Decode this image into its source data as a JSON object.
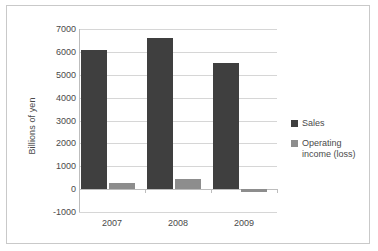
{
  "chart_data": {
    "type": "bar",
    "title": "",
    "subtitle": "",
    "xlabel": "",
    "ylabel": "Billions of yen",
    "categories": [
      "2007",
      "2008",
      "2009"
    ],
    "series": [
      {
        "name": "Sales",
        "color": "#3f3f3f",
        "values": [
          6100,
          6620,
          5500
        ]
      },
      {
        "name": "Operating income (loss)",
        "color": "#8d8d8d",
        "values": [
          250,
          440,
          -110
        ]
      }
    ],
    "ylim": [
      -1000,
      7000
    ],
    "ytick_labels": [
      "7000",
      "6000",
      "5000",
      "4000",
      "3000",
      "2000",
      "1000",
      "0",
      "-1000"
    ],
    "ytick_values": [
      7000,
      6000,
      5000,
      4000,
      3000,
      2000,
      1000,
      0,
      -1000
    ],
    "grid": true,
    "legend_position": "right",
    "annotations": []
  },
  "legend": {
    "items": [
      {
        "label": "Sales",
        "color": "#3f3f3f"
      },
      {
        "label": "Operating income (loss)",
        "color": "#8d8d8d"
      }
    ]
  },
  "colors": {
    "sales": "#3f3f3f",
    "operating_income": "#8d8d8d",
    "gridline": "#d6d6d6",
    "axis": "#bdbdbd",
    "text": "#4a4a4a",
    "frame": "#c9c9c9",
    "background": "#ffffff"
  }
}
